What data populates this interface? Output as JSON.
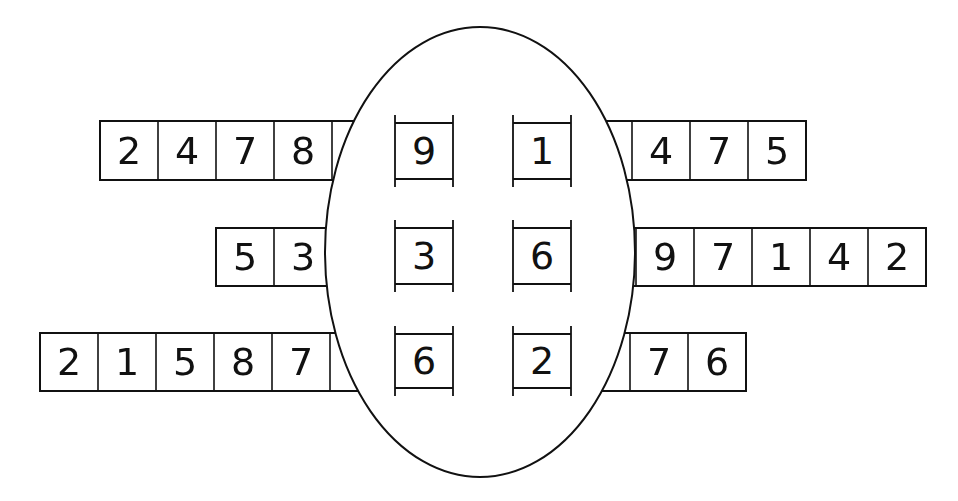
{
  "diagram": {
    "type": "digit-strip puzzle with central oval",
    "colors": {
      "ink": "#111111",
      "background": "#ffffff"
    },
    "oval": {
      "cx": 480,
      "cy": 252,
      "rx": 155,
      "ry": 225
    },
    "rows": [
      {
        "left_strip": [
          "2",
          "4",
          "7",
          "8"
        ],
        "inner_cells": [
          "9",
          "1"
        ],
        "right_strip": [
          "4",
          "7",
          "5"
        ]
      },
      {
        "left_strip": [
          "5",
          "3"
        ],
        "inner_cells": [
          "3",
          "6"
        ],
        "right_strip": [
          "9",
          "7",
          "1",
          "4",
          "2"
        ]
      },
      {
        "left_strip": [
          "2",
          "1",
          "5",
          "8",
          "7"
        ],
        "inner_cells": [
          "6",
          "2"
        ],
        "right_strip": [
          "7",
          "6"
        ]
      }
    ]
  }
}
